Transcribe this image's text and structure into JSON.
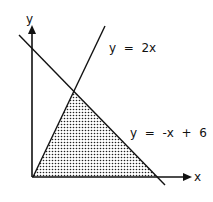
{
  "diagram": {
    "axes": {
      "x_label": "x",
      "y_label": "y"
    },
    "lines": [
      {
        "label": "y  =  2x",
        "equation": "y = 2x"
      },
      {
        "label": "y  =  -x  +  6",
        "equation": "y = -x + 6"
      }
    ],
    "shaded_region": "triangle bounded by y = 2x, y = -x + 6, and the x-axis",
    "colors": {
      "ink": "#111111",
      "background": "#ffffff"
    }
  }
}
